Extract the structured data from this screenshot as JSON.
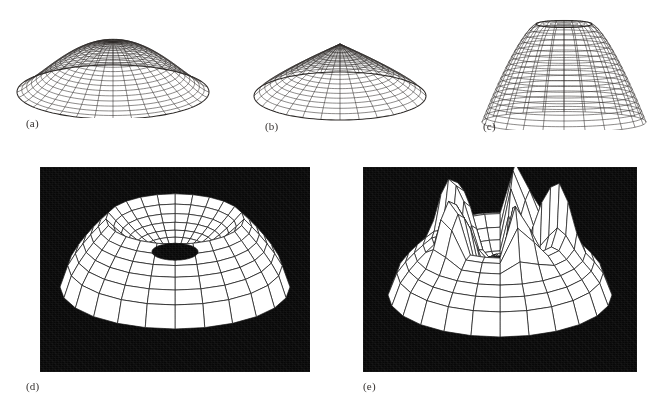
{
  "figure": {
    "background_color": "#ffffff",
    "ink_color": "#2e2b29",
    "dark_panel_color": "#080808",
    "surface_fill_color": "#ffffff",
    "width_px": 672,
    "height_px": 403,
    "panel_count": 5
  },
  "panels": [
    {
      "id": "a",
      "caption": "(a)",
      "render_style": "wireframe",
      "background": "white",
      "shape": "shallow dome / flattened bell surface of revolution",
      "radial_lines": 32,
      "ring_lines": 20,
      "box": {
        "x": 14,
        "y": 20,
        "w": 196,
        "h": 100
      }
    },
    {
      "id": "b",
      "caption": "(b)",
      "render_style": "wireframe",
      "background": "white",
      "shape": "cone-like dome with pointed apex",
      "radial_lines": 28,
      "ring_lines": 16,
      "box": {
        "x": 254,
        "y": 28,
        "w": 170,
        "h": 92
      }
    },
    {
      "id": "c",
      "caption": "(c)",
      "render_style": "wireframe",
      "background": "white",
      "shape": "tall bell / mushroom surface of revolution",
      "radial_lines": 24,
      "ring_lines": 18,
      "box": {
        "x": 470,
        "y": 6,
        "w": 186,
        "h": 120
      }
    },
    {
      "id": "d",
      "caption": "(d)",
      "render_style": "hidden-surface shaded polygons",
      "background": "black",
      "shape": "torus-like crater / donut with central depression",
      "radial_lines": 24,
      "ring_lines": 12,
      "box": {
        "x": 40,
        "y": 167,
        "w": 270,
        "h": 205
      }
    },
    {
      "id": "e",
      "caption": "(e)",
      "render_style": "hidden-surface shaded polygons",
      "background": "black",
      "shape": "crown / star-shaped spiked surface with central peak",
      "radial_lines": 24,
      "ring_lines": 12,
      "box": {
        "x": 363,
        "y": 167,
        "w": 274,
        "h": 205
      }
    }
  ],
  "captions": {
    "a": "(a)",
    "b": "(b)",
    "c": "(c)",
    "d": "(d)",
    "e": "(e)"
  }
}
